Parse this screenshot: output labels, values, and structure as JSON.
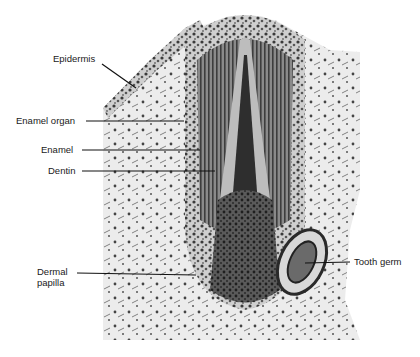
{
  "figure": {
    "type": "histology micrograph",
    "labels": [
      {
        "id": "epidermis",
        "text": "Epidermis"
      },
      {
        "id": "enamel-organ",
        "text": "Enamel organ"
      },
      {
        "id": "enamel",
        "text": "Enamel"
      },
      {
        "id": "dentin",
        "text": "Dentin"
      },
      {
        "id": "dermal-papilla",
        "text": "Dermal papilla"
      },
      {
        "id": "tooth-germ",
        "text": "Tooth germ"
      }
    ]
  }
}
